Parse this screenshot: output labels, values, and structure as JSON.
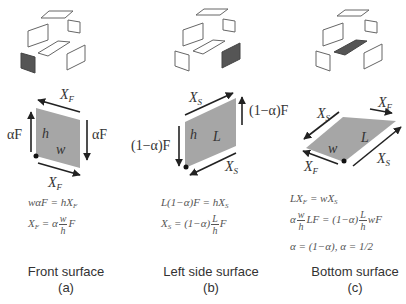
{
  "colors": {
    "face_fill": "#a6a6a6",
    "highlight_fill": "#555555",
    "stroke": "#333333",
    "outline": "#666666",
    "text": "#333333"
  },
  "panels": [
    {
      "id": "a",
      "surface_name": "Front surface",
      "panel_label": "(a)",
      "highlighted_face": "front",
      "face_labels": {
        "height": "h",
        "width": "w"
      },
      "force_labels": {
        "top": "X_F",
        "bottom": "X_F",
        "left": "αF",
        "right": "αF"
      },
      "equations": [
        "wαF = hX_F",
        "X_F = α (w/h) F"
      ]
    },
    {
      "id": "b",
      "surface_name": "Left side surface",
      "panel_label": "(b)",
      "highlighted_face": "right",
      "face_labels": {
        "height": "h",
        "length": "L"
      },
      "force_labels": {
        "top": "X_S",
        "bottom": "X_S",
        "left": "(1−α)F",
        "right": "(1−α)F"
      },
      "equations": [
        "L(1−α)F = hX_S",
        "X_S = (1−α) (L/h) F"
      ]
    },
    {
      "id": "c",
      "surface_name": "Bottom surface",
      "panel_label": "(c)",
      "highlighted_face": "bottom",
      "face_labels": {
        "width": "w",
        "length": "L"
      },
      "force_labels": {
        "top_left": "X_S",
        "top_right": "X_F",
        "bottom_left": "X_F",
        "bottom_right": "X_S"
      },
      "equations": [
        "LX_F = wX_S",
        "α (w/h) LF = (1−α) (L/h) wF",
        "α = (1−α),   α = 1/2"
      ]
    }
  ],
  "text": {
    "a_xf_top": "X",
    "a_xf_top_sub": "F",
    "a_xf_bot": "X",
    "a_xf_bot_sub": "F",
    "a_af_left": "αF",
    "a_af_right": "αF",
    "a_h": "h",
    "a_w": "w",
    "a_eq1": "wαF = hX",
    "a_eq1_sub": "F",
    "a_eq2_lhs": "X",
    "a_eq2_lhs_sub": "F",
    "a_eq2_mid": " = α",
    "a_eq2_num": "w",
    "a_eq2_den": "h",
    "a_eq2_rhs": "F",
    "b_xs_top": "X",
    "b_xs_top_sub": "S",
    "b_xs_bot": "X",
    "b_xs_bot_sub": "S",
    "b_f_left": "(1−α)F",
    "b_f_right": "(1−α)F",
    "b_h": "h",
    "b_L": "L",
    "b_eq1": "L(1−α)F = hX",
    "b_eq1_sub": "S",
    "b_eq2_lhs": "X",
    "b_eq2_lhs_sub": "S",
    "b_eq2_mid": " = (1−α)",
    "b_eq2_num": "L",
    "b_eq2_den": "h",
    "b_eq2_rhs": "F",
    "c_xs_tl": "X",
    "c_xs_tl_sub": "S",
    "c_xf_tr": "X",
    "c_xf_tr_sub": "F",
    "c_xf_bl": "X",
    "c_xf_bl_sub": "F",
    "c_xs_br": "X",
    "c_xs_br_sub": "S",
    "c_w": "w",
    "c_L": "L",
    "c_eq1": "LX",
    "c_eq1_sub": "F",
    "c_eq1_rest": " = wX",
    "c_eq1_sub2": "S",
    "c_eq2_a": "α",
    "c_eq2_num1": "w",
    "c_eq2_den1": "h",
    "c_eq2_mid": "LF = (1−α)",
    "c_eq2_num2": "L",
    "c_eq2_den2": "h",
    "c_eq2_rhs": "wF",
    "c_eq3": "α = (1−α),   α = 1/2",
    "cap_a": "Front surface",
    "cap_a2": "(a)",
    "cap_b": "Left side surface",
    "cap_b2": "(b)",
    "cap_c": "Bottom surface",
    "cap_c2": "(c)"
  }
}
